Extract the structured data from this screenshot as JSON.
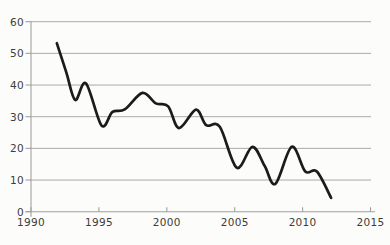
{
  "chart_data": {
    "type": "line",
    "title": "",
    "xlabel": "",
    "ylabel": "",
    "legend": "none",
    "grid": "horizontal",
    "x_axis": {
      "range": [
        1990,
        2015
      ],
      "ticks": [
        1990,
        1995,
        2000,
        2005,
        2010,
        2015
      ],
      "tick_labels": [
        "1990",
        "1995",
        "2000",
        "2005",
        "2010",
        "2015"
      ]
    },
    "y_axis": {
      "range": [
        0,
        60
      ],
      "ticks": [
        0,
        10,
        20,
        30,
        40,
        50,
        60
      ],
      "tick_labels": [
        "0",
        "10",
        "20",
        "30",
        "40",
        "50",
        "60"
      ]
    },
    "series": [
      {
        "name": "declining-trend-line",
        "color": "#1b1b1b",
        "stroke_width": 2.7,
        "points": [
          [
            1991.9,
            53.2
          ],
          [
            1992.6,
            44.0
          ],
          [
            1993.25,
            35.3
          ],
          [
            1994.05,
            40.5
          ],
          [
            1995.2,
            27.2
          ],
          [
            1996.0,
            31.5
          ],
          [
            1996.9,
            32.3
          ],
          [
            1998.2,
            37.5
          ],
          [
            1999.2,
            34.2
          ],
          [
            2000.1,
            33.3
          ],
          [
            2000.9,
            26.4
          ],
          [
            2002.15,
            32.2
          ],
          [
            2002.9,
            27.3
          ],
          [
            2003.9,
            26.8
          ],
          [
            2005.15,
            13.9
          ],
          [
            2006.3,
            20.5
          ],
          [
            2007.2,
            14.5
          ],
          [
            2008.0,
            8.8
          ],
          [
            2009.2,
            20.5
          ],
          [
            2010.2,
            12.7
          ],
          [
            2011.05,
            12.7
          ],
          [
            2012.1,
            4.4
          ]
        ]
      }
    ],
    "colors": {
      "background": "#fcfcfa",
      "grid": "#aaaaaa",
      "axis": "#a0a0a0",
      "tick_label": "#3c3c3c",
      "line": "#1b1b1b"
    }
  }
}
